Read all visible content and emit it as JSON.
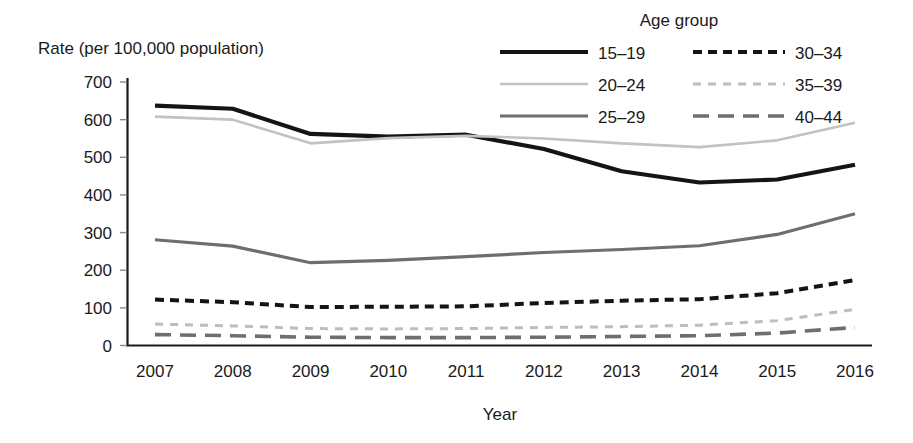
{
  "chart_data": {
    "type": "line",
    "title": "",
    "ylabel": "Rate (per 100,000 population)",
    "xlabel": "Year",
    "legend_title": "Age group",
    "legend_position": "top-right",
    "grid": false,
    "ylim": [
      0,
      700
    ],
    "yticks": [
      0,
      100,
      200,
      300,
      400,
      500,
      600,
      700
    ],
    "ytick_labels": [
      "0",
      "100",
      "200",
      "300",
      "400",
      "500",
      "600",
      "700"
    ],
    "x": [
      2007,
      2008,
      2009,
      2010,
      2011,
      2012,
      2013,
      2014,
      2015,
      2016
    ],
    "xtick_labels": [
      "2007",
      "2008",
      "2009",
      "2010",
      "2011",
      "2012",
      "2013",
      "2014",
      "2015",
      "2016"
    ],
    "series": [
      {
        "name": "15–19",
        "values": [
          637,
          629,
          562,
          555,
          560,
          522,
          463,
          433,
          441,
          480
        ],
        "color": "#141414",
        "width": 4.2,
        "dash": "none"
      },
      {
        "name": "20–24",
        "values": [
          608,
          600,
          537,
          551,
          557,
          550,
          537,
          527,
          545,
          592
        ],
        "color": "#c2c2c2",
        "width": 2.6,
        "dash": "none"
      },
      {
        "name": "25–29",
        "values": [
          281,
          264,
          220,
          226,
          236,
          247,
          255,
          265,
          295,
          350
        ],
        "color": "#6e6e6e",
        "width": 3.2,
        "dash": "none"
      },
      {
        "name": "30–34",
        "values": [
          122,
          115,
          102,
          103,
          104,
          113,
          119,
          123,
          139,
          174
        ],
        "color": "#141414",
        "width": 4.0,
        "dash": "9 6"
      },
      {
        "name": "35–39",
        "values": [
          57,
          52,
          45,
          44,
          45,
          48,
          50,
          54,
          66,
          96
        ],
        "color": "#bdbdbd",
        "width": 3.0,
        "dash": "8 7"
      },
      {
        "name": "40–44",
        "values": [
          29,
          26,
          22,
          21,
          21,
          22,
          24,
          26,
          33,
          48
        ],
        "color": "#6e6e6e",
        "width": 3.6,
        "dash": "16 9"
      }
    ]
  },
  "legend": {
    "title": "Age group",
    "entries": [
      {
        "label": "15–19",
        "column": 0,
        "row": 0
      },
      {
        "label": "20–24",
        "column": 0,
        "row": 1
      },
      {
        "label": "25–29",
        "column": 0,
        "row": 2
      },
      {
        "label": "30–34",
        "column": 1,
        "row": 0
      },
      {
        "label": "35–39",
        "column": 1,
        "row": 1
      },
      {
        "label": "40–44",
        "column": 1,
        "row": 2
      }
    ]
  },
  "axes": {
    "y_axis_title": "Rate (per 100,000 population)",
    "x_axis_title": "Year"
  }
}
